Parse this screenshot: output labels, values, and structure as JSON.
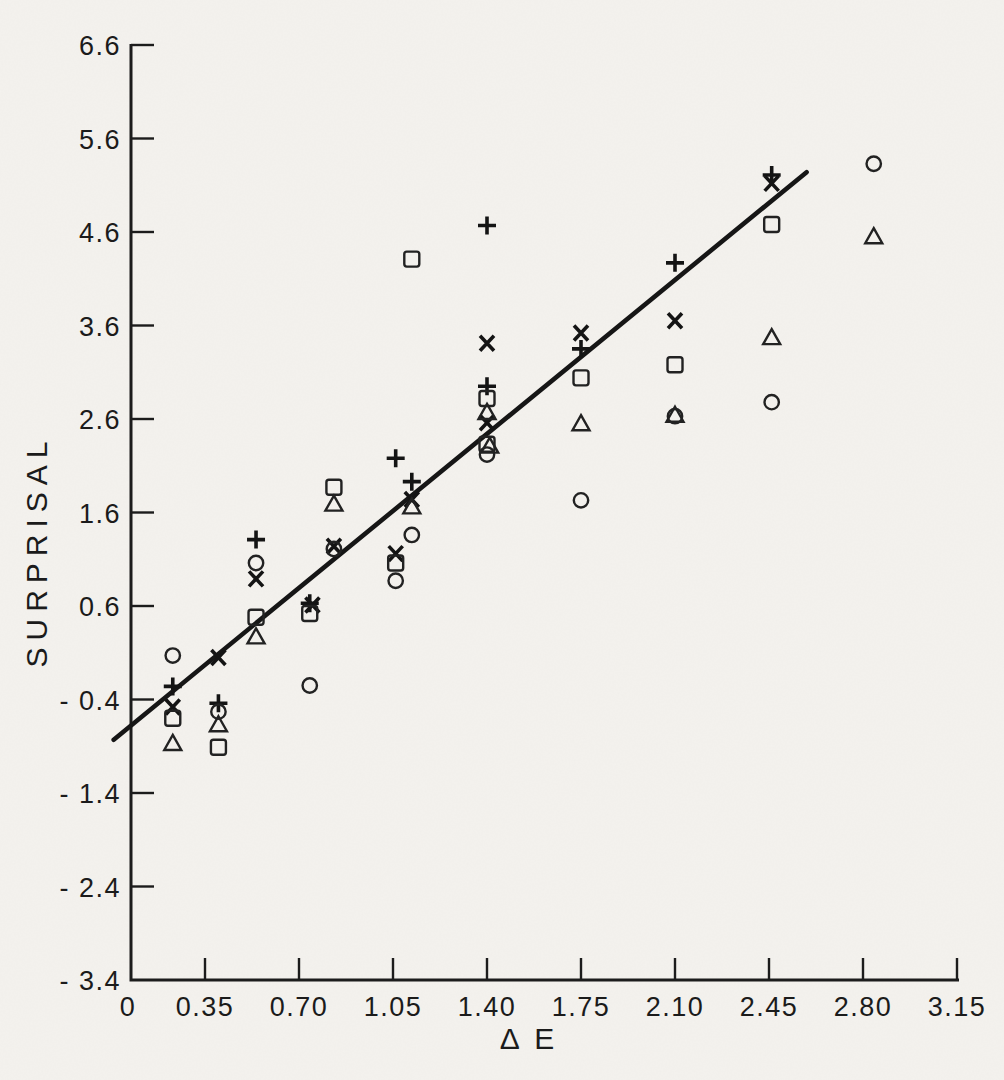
{
  "figure": {
    "paper_color": "#f4f2ee",
    "ink_color": "#1c1c1c"
  },
  "chart_data": {
    "type": "scatter",
    "title": "",
    "xlabel": "Δ E",
    "ylabel": "SURPRISAL",
    "xlim": [
      0,
      3.15
    ],
    "ylim": [
      -3.4,
      6.6
    ],
    "grid": false,
    "legend": "none",
    "x_ticks": [
      {
        "label": "0",
        "value": 0
      },
      {
        "label": "0.35",
        "value": 0.35
      },
      {
        "label": "0.70",
        "value": 0.7
      },
      {
        "label": "1.05",
        "value": 1.05
      },
      {
        "label": "1.40",
        "value": 1.4
      },
      {
        "label": "1.75",
        "value": 1.75
      },
      {
        "label": "2.10",
        "value": 2.1
      },
      {
        "label": "2.45",
        "value": 2.45
      },
      {
        "label": "2.80",
        "value": 2.8
      },
      {
        "label": "3.15",
        "value": 3.15
      }
    ],
    "y_ticks": [
      {
        "label": "6.6",
        "value": 6.6
      },
      {
        "label": "5.6",
        "value": 5.6
      },
      {
        "label": "4.6",
        "value": 4.6
      },
      {
        "label": "3.6",
        "value": 3.6
      },
      {
        "label": "2.6",
        "value": 2.6
      },
      {
        "label": "1.6",
        "value": 1.6
      },
      {
        "label": "0.6",
        "value": 0.6
      },
      {
        "label": "- 0.4",
        "value": -0.4
      },
      {
        "label": "- 1.4",
        "value": -1.4
      },
      {
        "label": "- 2.4",
        "value": -2.4
      },
      {
        "label": "- 3.4",
        "value": -3.4
      }
    ],
    "fit_line": {
      "x1": 0.01,
      "y1": -0.83,
      "x2": 2.59,
      "y2": 5.24,
      "slope": 2.35,
      "intercept": -0.85
    },
    "series": [
      {
        "name": "plus",
        "marker": "plus",
        "points": [
          [
            0.23,
            -0.26
          ],
          [
            0.4,
            -0.44
          ],
          [
            0.54,
            1.31
          ],
          [
            0.74,
            0.63
          ],
          [
            1.06,
            2.18
          ],
          [
            1.12,
            1.93
          ],
          [
            1.4,
            4.67
          ],
          [
            1.4,
            2.95
          ],
          [
            1.75,
            3.35
          ],
          [
            2.1,
            4.27
          ],
          [
            2.46,
            5.21
          ]
        ]
      },
      {
        "name": "cross",
        "marker": "cross",
        "points": [
          [
            0.23,
            -0.48
          ],
          [
            0.4,
            0.05
          ],
          [
            0.54,
            0.89
          ],
          [
            0.75,
            0.61
          ],
          [
            0.83,
            1.24
          ],
          [
            1.06,
            1.16
          ],
          [
            1.12,
            1.74
          ],
          [
            1.4,
            3.41
          ],
          [
            1.4,
            2.56
          ],
          [
            1.75,
            3.52
          ],
          [
            2.1,
            3.65
          ],
          [
            2.46,
            5.12
          ]
        ]
      },
      {
        "name": "square",
        "marker": "square",
        "points": [
          [
            0.23,
            -0.6
          ],
          [
            0.4,
            -0.91
          ],
          [
            0.54,
            0.48
          ],
          [
            0.74,
            0.52
          ],
          [
            0.83,
            1.87
          ],
          [
            1.06,
            1.06
          ],
          [
            1.12,
            4.31
          ],
          [
            1.4,
            2.82
          ],
          [
            1.4,
            2.33
          ],
          [
            1.75,
            3.04
          ],
          [
            2.1,
            3.18
          ],
          [
            2.46,
            4.68
          ]
        ]
      },
      {
        "name": "triangle",
        "marker": "triangle",
        "points": [
          [
            0.23,
            -0.87
          ],
          [
            0.4,
            -0.67
          ],
          [
            0.54,
            0.27
          ],
          [
            0.83,
            1.69
          ],
          [
            1.12,
            1.66
          ],
          [
            1.4,
            2.67
          ],
          [
            1.41,
            2.31
          ],
          [
            1.75,
            2.55
          ],
          [
            2.1,
            2.64
          ],
          [
            2.46,
            3.47
          ],
          [
            2.84,
            4.55
          ]
        ]
      },
      {
        "name": "circle",
        "marker": "circle",
        "points": [
          [
            0.23,
            0.07
          ],
          [
            0.4,
            -0.53
          ],
          [
            0.54,
            1.06
          ],
          [
            0.74,
            -0.25
          ],
          [
            0.83,
            1.21
          ],
          [
            1.06,
            0.87
          ],
          [
            1.12,
            1.36
          ],
          [
            1.4,
            2.22
          ],
          [
            1.75,
            1.73
          ],
          [
            2.1,
            2.63
          ],
          [
            2.46,
            2.78
          ],
          [
            2.84,
            5.33
          ]
        ]
      }
    ]
  }
}
